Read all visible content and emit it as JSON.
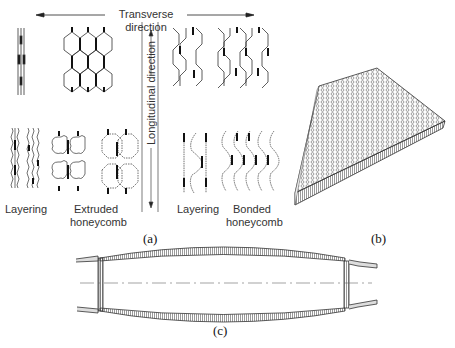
{
  "panel_a": {
    "transverse_label": "Transverse direction",
    "longitudinal_label": "Longitudinal direction",
    "labels": {
      "layering_left": "Layering",
      "extruded": "Extruded\nhoneycomb",
      "layering_right": "Layering",
      "bonded": "Bonded\nhoneycomb"
    },
    "caption": "(a)"
  },
  "panel_b": {
    "caption": "(b)"
  },
  "panel_c": {
    "caption": "(c)"
  }
}
